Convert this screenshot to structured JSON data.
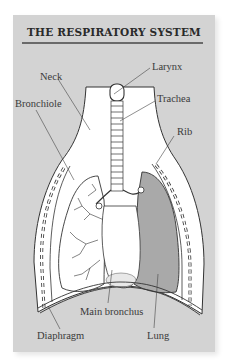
{
  "title": "THE RESPIRATORY SYSTEM",
  "colors": {
    "card_background": "#d3d3d3",
    "title_rule": "#6a6a6a",
    "line": "#333333",
    "body_fill": "#ffffff",
    "lung_fill": "#a9a9a9"
  },
  "labels": {
    "larynx": "Larynx",
    "neck": "Neck",
    "trachea": "Trachea",
    "bronchiole": "Bronchiole",
    "rib": "Rib",
    "main_bronchus": "Main bronchus",
    "diaphragm": "Diaphragm",
    "lung": "Lung"
  }
}
